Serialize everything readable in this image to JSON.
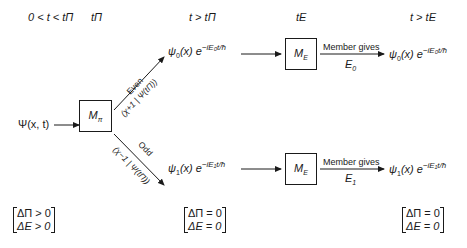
{
  "headers": [
    {
      "id": "h0",
      "text": "0 < t < tΠ"
    },
    {
      "id": "h1",
      "text": "tΠ"
    },
    {
      "id": "h2",
      "text": "t > tΠ"
    },
    {
      "id": "h3",
      "text": "tE"
    },
    {
      "id": "h4",
      "text": "t > tE"
    }
  ],
  "input": {
    "label": "Ψ(x, t)"
  },
  "boxes": {
    "parity": {
      "label": "M",
      "sub": "π"
    },
    "energy_top": {
      "label": "M",
      "sub": "E"
    },
    "energy_bottom": {
      "label": "M",
      "sub": "E"
    }
  },
  "branches": {
    "even": {
      "label": "Even",
      "amplitude": "(χ+1 | Ψ(tΠ))"
    },
    "odd": {
      "label": "Odd",
      "amplitude": "(χ−1 | Ψ(tΠ))"
    }
  },
  "states": {
    "top_mid": {
      "psi": "ψ",
      "psi_sub": "0",
      "rest": "(x) e",
      "exp": "−iE₀t/ħ"
    },
    "bottom_mid": {
      "psi": "ψ",
      "psi_sub": "1",
      "rest": "(x) e",
      "exp": "−iE₁t/ħ"
    },
    "top_right": {
      "psi": "ψ",
      "psi_sub": "0",
      "rest": "(x) e",
      "exp": "−iE₀t/ħ"
    },
    "bottom_right": {
      "psi": "ψ",
      "psi_sub": "1",
      "rest": "(x) e",
      "exp": "−iE₁t/ħ"
    }
  },
  "measurements": {
    "top": {
      "text": "Member gives",
      "value": "E",
      "value_sub": "0"
    },
    "bottom": {
      "text": "Member gives",
      "value": "E",
      "value_sub": "1"
    }
  },
  "conditions": [
    {
      "line1": "ΔΠ > 0",
      "line2": "ΔE > 0"
    },
    {
      "line1": "ΔΠ = 0",
      "line2": "ΔE = 0"
    },
    {
      "line1": "ΔΠ = 0",
      "line2": "ΔE = 0"
    }
  ],
  "colors": {
    "ink": "#1a1a1a",
    "background": "#ffffff"
  }
}
